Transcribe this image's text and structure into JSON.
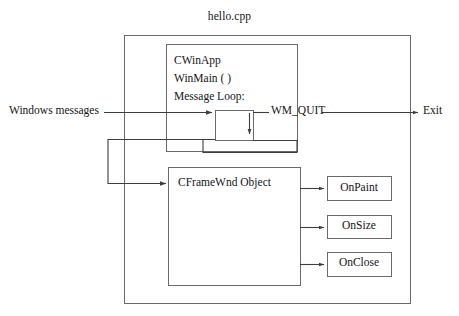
{
  "diagram": {
    "title": "hello.cpp",
    "type": "mfc-application-flow-diagram",
    "colors": {
      "stroke": "#4a4a4a",
      "text": "#141414",
      "background": "#ffffff"
    },
    "nodes": {
      "outer_container": {
        "label": "hello.cpp",
        "x": 124,
        "y": 35,
        "w": 286,
        "h": 268
      },
      "cwinapp_box": {
        "lines": [
          "CWinApp",
          "WinMain ( )",
          "Message Loop:"
        ],
        "line1": "CWinApp",
        "line2": "WinMain ( )",
        "line3": "Message Loop:",
        "x": 166,
        "y": 44,
        "w": 131,
        "h": 107
      },
      "message_loop_box": {
        "label": "",
        "x": 215,
        "y": 110,
        "w": 38,
        "h": 30
      },
      "cframewnd_box": {
        "label": "CFrameWnd Object",
        "x": 168,
        "y": 167,
        "w": 132,
        "h": 118
      },
      "handlers": [
        {
          "label": "OnPaint",
          "x": 327,
          "y": 176,
          "w": 64,
          "h": 24
        },
        {
          "label": "OnSize",
          "x": 327,
          "y": 215,
          "w": 64,
          "h": 23
        },
        {
          "label": "OnClose",
          "x": 327,
          "y": 252,
          "w": 64,
          "h": 24
        }
      ]
    },
    "edge_labels": {
      "windows_messages": "Windows messages",
      "wm_quit": "WM_QUIT",
      "exit": "Exit"
    },
    "edges": [
      {
        "from": "windows-messages",
        "to": "message-loop-box",
        "label": "Windows messages"
      },
      {
        "from": "message-loop-box",
        "to": "exit",
        "label": "WM_QUIT"
      },
      {
        "from": "message-loop-box",
        "to": "cframewnd-box",
        "label": ""
      },
      {
        "from": "cframewnd-box",
        "to": "onpaint",
        "label": ""
      },
      {
        "from": "cframewnd-box",
        "to": "onsize",
        "label": ""
      },
      {
        "from": "cframewnd-box",
        "to": "onclose",
        "label": ""
      }
    ]
  }
}
